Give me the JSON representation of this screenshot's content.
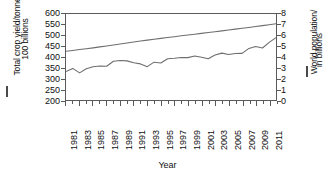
{
  "chart_data": {
    "type": "line",
    "title": "",
    "xlabel": "Year",
    "ylabel_left": "Total crop yield/tonnes, in 100 billions",
    "ylabel_left_line1": "Total crop yield/tonnes, in",
    "ylabel_left_line2": "100 billions",
    "ylabel_right": "World population/ in billions",
    "ylabel_right_line1": "World population/",
    "ylabel_right_line2": "in billions",
    "legend_marker_left": "—",
    "legend_marker_right": "—",
    "grid": false,
    "legend_position": "axis-titles",
    "line_color": "#6e6e6e",
    "axis_color": "#5a5a5a",
    "text_color": "#101010",
    "background": "#ffffff",
    "ylim_left": [
      200,
      600
    ],
    "ylim_right": [
      0,
      8
    ],
    "yticks_left": [
      600,
      550,
      500,
      450,
      400,
      350,
      300,
      250,
      200
    ],
    "yticks_right": [
      8,
      7,
      6,
      5,
      4,
      3,
      2,
      1,
      0
    ],
    "xlim": [
      1981,
      2012
    ],
    "xticks": [
      1981,
      1983,
      1985,
      1987,
      1989,
      1991,
      1993,
      1995,
      1997,
      1999,
      2001,
      2003,
      2005,
      2007,
      2009,
      2011
    ],
    "x": [
      1981,
      1982,
      1983,
      1984,
      1985,
      1986,
      1987,
      1988,
      1989,
      1990,
      1991,
      1992,
      1993,
      1994,
      1995,
      1996,
      1997,
      1998,
      1999,
      2000,
      2001,
      2002,
      2003,
      2004,
      2005,
      2006,
      2007,
      2008,
      2009,
      2010,
      2011,
      2012
    ],
    "series": [
      {
        "name": "World population",
        "axis": "right",
        "units": "billions",
        "values": [
          4.53,
          4.61,
          4.69,
          4.77,
          4.85,
          4.94,
          5.03,
          5.12,
          5.21,
          5.31,
          5.4,
          5.48,
          5.57,
          5.65,
          5.73,
          5.81,
          5.89,
          5.97,
          6.04,
          6.12,
          6.2,
          6.28,
          6.35,
          6.43,
          6.51,
          6.59,
          6.67,
          6.75,
          6.83,
          6.92,
          7.0,
          7.09
        ]
      },
      {
        "name": "Total crop yield",
        "axis": "left",
        "units": "tonnes, in 100 billions",
        "values": [
          332,
          347,
          326,
          345,
          355,
          358,
          357,
          380,
          384,
          382,
          373,
          368,
          355,
          376,
          372,
          392,
          394,
          398,
          397,
          405,
          399,
          392,
          409,
          418,
          412,
          416,
          417,
          440,
          449,
          442,
          468,
          490
        ]
      }
    ]
  }
}
